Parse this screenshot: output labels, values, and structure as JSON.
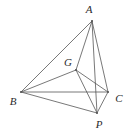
{
  "figure": {
    "type": "geometry-diagram",
    "canvas": {
      "width": 130,
      "height": 134
    },
    "background_color": "#ffffff",
    "line_color": "#555555",
    "line_width": 0.8,
    "label_color": "#2b2b2b",
    "vertices": [
      {
        "id": "A",
        "label": "A",
        "x": 92,
        "y": 21,
        "label_x": 89,
        "label_y": 9
      },
      {
        "id": "B",
        "label": "B",
        "x": 21,
        "y": 92,
        "label_x": 13,
        "label_y": 101
      },
      {
        "id": "C",
        "label": "C",
        "x": 108,
        "y": 92,
        "label_x": 119,
        "label_y": 98
      },
      {
        "id": "P",
        "label": "P",
        "x": 97,
        "y": 113,
        "label_x": 99,
        "label_y": 124
      },
      {
        "id": "G",
        "label": "G",
        "x": 76,
        "y": 70,
        "label_x": 68,
        "label_y": 62
      }
    ],
    "edges": [
      {
        "from": "A",
        "to": "B"
      },
      {
        "from": "A",
        "to": "C"
      },
      {
        "from": "A",
        "to": "P"
      },
      {
        "from": "A",
        "to": "G"
      },
      {
        "from": "B",
        "to": "C"
      },
      {
        "from": "B",
        "to": "P"
      },
      {
        "from": "B",
        "to": "G"
      },
      {
        "from": "C",
        "to": "P"
      },
      {
        "from": "C",
        "to": "G"
      },
      {
        "from": "G",
        "to": "P"
      }
    ]
  }
}
